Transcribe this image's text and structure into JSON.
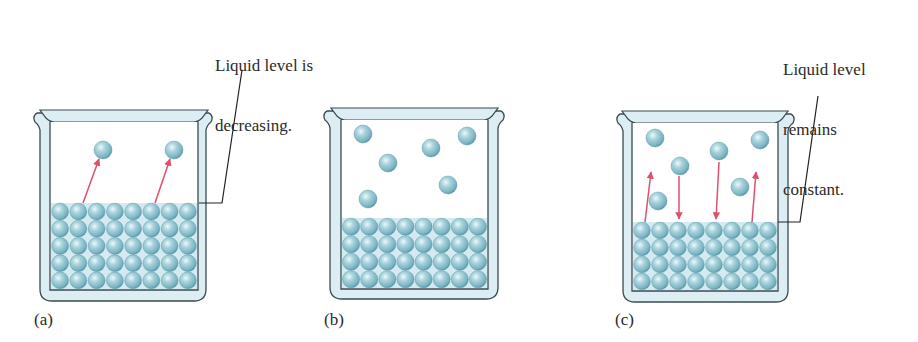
{
  "figure": {
    "panels": [
      {
        "id": "a",
        "label": "(a)",
        "caption_lines": [
          "Liquid level is",
          "decreasing."
        ],
        "liquid_rows": 5,
        "liquid_cols": 8,
        "vapor_molecules": 2,
        "arrows": [
          {
            "direction": "up",
            "meaning": "evaporation"
          },
          {
            "direction": "up",
            "meaning": "evaporation"
          }
        ]
      },
      {
        "id": "b",
        "label": "(b)",
        "caption_lines": [],
        "liquid_rows": 4,
        "liquid_cols": 8,
        "vapor_molecules": 6,
        "arrows": []
      },
      {
        "id": "c",
        "label": "(c)",
        "caption_lines": [
          "Liquid level",
          "remains",
          "constant."
        ],
        "liquid_rows": 4,
        "liquid_cols": 8,
        "vapor_molecules": 6,
        "arrows": [
          {
            "direction": "up",
            "meaning": "evaporation"
          },
          {
            "direction": "down",
            "meaning": "condensation"
          },
          {
            "direction": "down",
            "meaning": "condensation"
          },
          {
            "direction": "up",
            "meaning": "evaporation"
          }
        ]
      }
    ],
    "colors": {
      "glass_fill": "#dcedf3",
      "glass_outline": "#3b4a52",
      "molecule": "#8fc4d0",
      "molecule_highlight": "#e6f4f7",
      "molecule_shadow": "#4f8e9c",
      "arrow": "#e0506a",
      "leader_line": "#222222",
      "text": "#2a2a2a"
    }
  }
}
